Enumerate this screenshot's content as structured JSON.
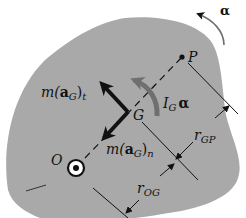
{
  "colors": {
    "body_fill": "#a9a9a9",
    "background": "#ffffff",
    "ink": "#111111",
    "moment_arrow": "#6f6f6f"
  },
  "labels": {
    "alpha_top": "α",
    "point_P": "P",
    "point_G": "G",
    "point_O": "O",
    "force_t": {
      "m": "m(",
      "a": "a",
      "sub": "G",
      "close": ")",
      "sub2": "t"
    },
    "force_n": {
      "m": "m(",
      "a": "a",
      "sub": "G",
      "close": ")",
      "sub2": "n"
    },
    "moment": {
      "I": "I",
      "sub": "G",
      "alpha": "α"
    },
    "r_GP": {
      "r": "r",
      "sub": "GP"
    },
    "r_OG": {
      "r": "r",
      "sub": "OG"
    }
  }
}
